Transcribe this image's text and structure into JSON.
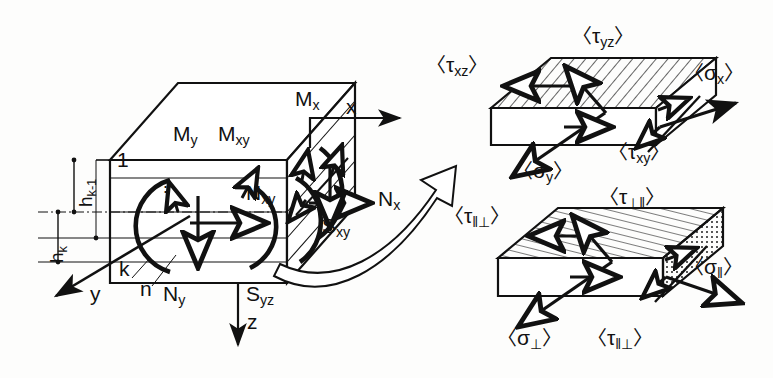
{
  "figure": {
    "background_color": "#fdfdfc",
    "ink_color": "#111111"
  },
  "main_element": {
    "name": "laminate-plate-element",
    "moment_labels": {
      "mx": {
        "base": "M",
        "sub": "x"
      },
      "my": {
        "base": "M",
        "sub": "y"
      },
      "mxy": {
        "base": "M",
        "sub": "xy"
      }
    },
    "force_labels": {
      "nx": {
        "base": "N",
        "sub": "x"
      },
      "ny": {
        "base": "N",
        "sub": "y"
      },
      "nxy": {
        "base": "N",
        "sub": "xy"
      },
      "sxy": {
        "base": "S",
        "sub": "xy"
      },
      "syz": {
        "base": "S",
        "sub": "yz"
      }
    },
    "axes": {
      "x": "x",
      "y": "y",
      "z": "z"
    },
    "layer_indices": {
      "first": "1",
      "dots": "⋮",
      "k": "k",
      "n": "n"
    },
    "thickness_labels": {
      "h_k_minus_1": {
        "base": "h",
        "sub": "k-1"
      },
      "h_k": {
        "base": "h",
        "sub": "k"
      }
    }
  },
  "upper_element": {
    "name": "layer-element-global-axes",
    "stress_labels": {
      "tau_yz": {
        "open": "〈",
        "base": "τ",
        "sub": "yz",
        "close": "〉"
      },
      "tau_xz": {
        "open": "〈",
        "base": "τ",
        "sub": "xz",
        "close": "〉"
      },
      "sigma_x": {
        "open": "〈",
        "base": "σ",
        "sub": "x",
        "close": "〉"
      },
      "sigma_y": {
        "open": "〈",
        "base": "σ",
        "sub": "y",
        "close": "〉"
      },
      "tau_xy": {
        "open": "〈",
        "base": "τ",
        "sub": "xy",
        "close": "〉"
      }
    },
    "fill_pattern": "diagonal-hatch"
  },
  "lower_element": {
    "name": "layer-element-material-axes",
    "stress_labels": {
      "tau_perp_par": {
        "open": "〈",
        "base": "τ",
        "sub": "⊥‖",
        "close": "〉"
      },
      "tau_par_perp_side": {
        "open": "〈",
        "base": "τ",
        "sub": "‖⊥",
        "close": "〉"
      },
      "sigma_par": {
        "open": "〈",
        "base": "σ",
        "sub": "‖",
        "close": "〉"
      },
      "sigma_perp": {
        "open": "〈",
        "base": "σ",
        "sub": "⊥",
        "close": "〉"
      },
      "tau_par_perp": {
        "open": "〈",
        "base": "τ",
        "sub": "‖⊥",
        "close": "〉"
      }
    },
    "fill_pattern_top": "horizontal-lines",
    "fill_pattern_side": "stipple-dots"
  },
  "connector": {
    "name": "magnify-arrow",
    "style": "hollow-curved-arrow"
  }
}
